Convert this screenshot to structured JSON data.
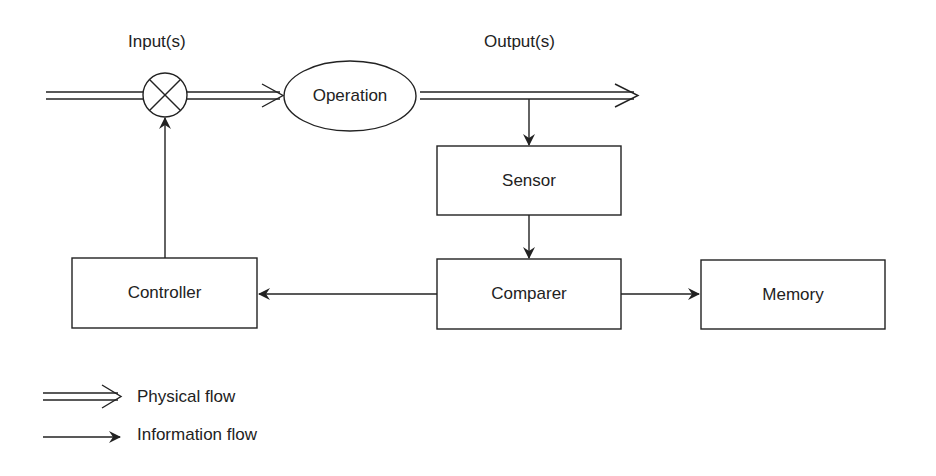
{
  "diagram": {
    "labels": {
      "inputs": "Input(s)",
      "outputs": "Output(s)"
    },
    "nodes": {
      "operation": "Operation",
      "sensor": "Sensor",
      "comparer": "Comparer",
      "controller": "Controller",
      "memory": "Memory"
    },
    "junction_icon": "summing-junction-x-circle",
    "edges": [
      {
        "from": "input",
        "to": "junction",
        "type": "physical"
      },
      {
        "from": "junction",
        "to": "operation",
        "type": "physical"
      },
      {
        "from": "operation",
        "to": "output",
        "type": "physical"
      },
      {
        "from": "output",
        "to": "sensor",
        "type": "information"
      },
      {
        "from": "sensor",
        "to": "comparer",
        "type": "information"
      },
      {
        "from": "comparer",
        "to": "controller",
        "type": "information"
      },
      {
        "from": "comparer",
        "to": "memory",
        "type": "information"
      },
      {
        "from": "controller",
        "to": "junction",
        "type": "information"
      }
    ]
  },
  "legend": {
    "physical": "Physical flow",
    "information": "Information flow"
  }
}
